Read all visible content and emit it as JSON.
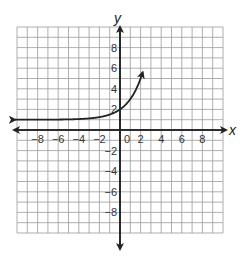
{
  "chart_data": {
    "type": "line",
    "title": "",
    "xlabel": "x",
    "ylabel": "y",
    "xlim": [
      -10,
      10
    ],
    "ylim": [
      -10,
      10
    ],
    "grid": true,
    "x_ticks": [
      "-8",
      "-6",
      "-4",
      "-2",
      "0",
      "2",
      "4",
      "6",
      "8"
    ],
    "y_ticks": [
      "8",
      "6",
      "4",
      "2",
      "-2",
      "-4",
      "-6",
      "-8"
    ],
    "series": [
      {
        "name": "exponential curve",
        "description": "y = 2^x + 1, horizontal asymptote y = 1, passes through (0, 2)",
        "x": [
          -10,
          -8,
          -6,
          -4,
          -2,
          -1,
          0,
          1,
          2,
          2.2
        ],
        "y": [
          1.0,
          1.0,
          1.02,
          1.06,
          1.25,
          1.5,
          2,
          3,
          5,
          9.5
        ]
      }
    ],
    "arrows": [
      "left end of curve",
      "top end of curve",
      "both ends of x-axis",
      "both ends of y-axis"
    ]
  },
  "labels": {
    "x_axis": "x",
    "y_axis": "y",
    "x_ticks": [
      "−8",
      "−6",
      "−4",
      "−2",
      "0",
      "2",
      "4",
      "6",
      "8"
    ],
    "y_ticks_pos": [
      "8",
      "6",
      "4",
      "2"
    ],
    "y_ticks_neg": [
      "−2",
      "−4",
      "−6",
      "−8"
    ]
  }
}
